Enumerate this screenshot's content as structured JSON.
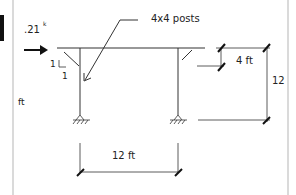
{
  "diagram": {
    "load_label": ".21",
    "load_superscript": "k",
    "leader_label": "4x4 posts",
    "slope_rise": "1",
    "slope_run": "1",
    "left_fragment_label": "ft",
    "brace_dim_label": "4 ft",
    "height_dim_label": "12",
    "span_dim_label": "12 ft"
  },
  "colors": {
    "line": "#333333",
    "tick": "#111111",
    "border": "#b0b0b0"
  }
}
